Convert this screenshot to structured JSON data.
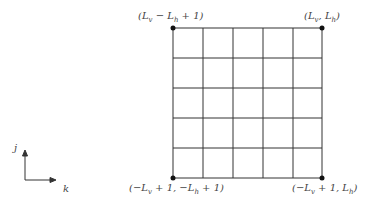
{
  "diagram": {
    "type": "lattice-grid",
    "grid": {
      "rows": 5,
      "cols": 5
    },
    "corner_labels": {
      "top_left": "(L_v − L_h + 1)",
      "top_right": "(L_v, L_h)",
      "bottom_left": "(−L_v + 1, −L_h + 1)",
      "bottom_right": "(−L_v + 1, L_h)"
    },
    "axes": {
      "vertical": "j",
      "horizontal": "k"
    }
  }
}
